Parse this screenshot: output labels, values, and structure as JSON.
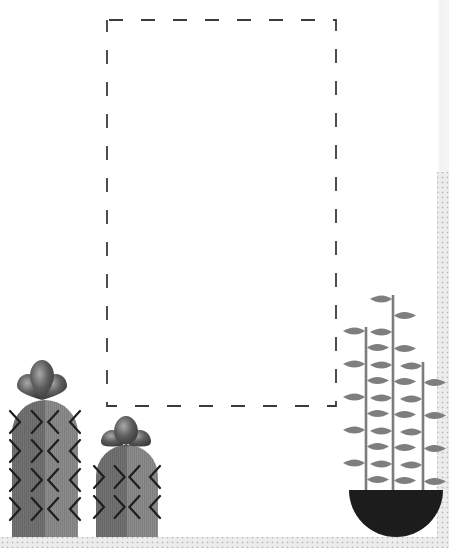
{
  "canvas": {
    "width": 449,
    "height": 548
  },
  "colors": {
    "background_dots": "#b9b9b9",
    "background": "#ececec",
    "card": "#ffffff",
    "dash": "#3a3a3a",
    "cactus_body": "#6f6f6f",
    "cactus_body_light": "#8a8a8a",
    "cactus_spines": "#1e1e1e",
    "flower": "#5a5a5a",
    "flower_highlight": "#a8a8a8",
    "stem": "#7c7c7c",
    "leaf": "#7e7e7e",
    "pot": "#1c1c1c"
  },
  "placeholder_frame": {
    "x": 107,
    "y": 20,
    "width": 229,
    "height": 386,
    "style": "dashed"
  },
  "cacti": [
    {
      "name": "tall-cactus",
      "x": 12,
      "top": 400,
      "width": 66,
      "bottom": 537,
      "flower_cx": 42,
      "flower_cy": 382,
      "spine_rows": 4
    },
    {
      "name": "short-cactus",
      "x": 96,
      "top": 445,
      "width": 62,
      "bottom": 537,
      "flower_cx": 126,
      "flower_cy": 438,
      "spine_rows": 2
    }
  ],
  "potted_plant": {
    "pot": {
      "cx": 396,
      "top": 490,
      "rx": 47,
      "ry": 47
    },
    "stems": [
      {
        "x": 366,
        "top": 327
      },
      {
        "x": 393,
        "top": 295
      },
      {
        "x": 423,
        "top": 362
      }
    ]
  }
}
